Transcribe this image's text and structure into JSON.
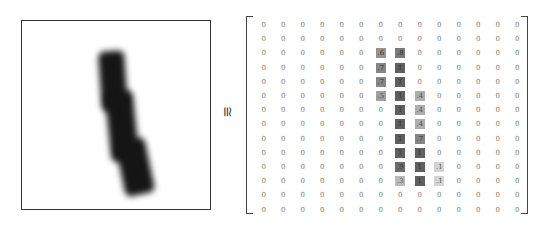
{
  "figure": {
    "image_label": "handwritten digit 1 (grayscale 28x28 rendering)",
    "relation_symbol": "≅",
    "matrix": {
      "rows": 14,
      "cols": 14,
      "values": [
        [
          "0",
          "0",
          "0",
          "0",
          "0",
          "0",
          "0",
          "0",
          "0",
          "0",
          "0",
          "0",
          "0",
          "0"
        ],
        [
          "0",
          "0",
          "0",
          "0",
          "0",
          "0",
          "0",
          "0",
          "0",
          "0",
          "0",
          "0",
          "0",
          "0"
        ],
        [
          "0",
          "0",
          "0",
          "0",
          "0",
          "0",
          ".6",
          ".8",
          "0",
          "0",
          "0",
          "0",
          "0",
          "0"
        ],
        [
          "0",
          "0",
          "0",
          "0",
          "0",
          "0",
          ".7",
          "1",
          "0",
          "0",
          "0",
          "0",
          "0",
          "0"
        ],
        [
          "0",
          "0",
          "0",
          "0",
          "0",
          "0",
          ".7",
          "1",
          "0",
          "0",
          "0",
          "0",
          "0",
          "0"
        ],
        [
          "0",
          "0",
          "0",
          "0",
          "0",
          "0",
          ".5",
          "1",
          ".4",
          "0",
          "0",
          "0",
          "0",
          "0"
        ],
        [
          "0",
          "0",
          "0",
          "0",
          "0",
          "0",
          "0",
          "1",
          ".4",
          "0",
          "0",
          "0",
          "0",
          "0"
        ],
        [
          "0",
          "0",
          "0",
          "0",
          "0",
          "0",
          "0",
          "1",
          ".4",
          "0",
          "0",
          "0",
          "0",
          "0"
        ],
        [
          "0",
          "0",
          "0",
          "0",
          "0",
          "0",
          "0",
          "1",
          ".7",
          "0",
          "0",
          "0",
          "0",
          "0"
        ],
        [
          "0",
          "0",
          "0",
          "0",
          "0",
          "0",
          "0",
          "1",
          "1",
          "0",
          "0",
          "0",
          "0",
          "0"
        ],
        [
          "0",
          "0",
          "0",
          "0",
          "0",
          "0",
          "0",
          ".9",
          "1",
          ".1",
          "0",
          "0",
          "0",
          "0"
        ],
        [
          "0",
          "0",
          "0",
          "0",
          "0",
          "0",
          "0",
          ".3",
          "1",
          ".1",
          "0",
          "0",
          "0",
          "0"
        ],
        [
          "0",
          "0",
          "0",
          "0",
          "0",
          "0",
          "0",
          "0",
          "0",
          "0",
          "0",
          "0",
          "0",
          "0"
        ],
        [
          "0",
          "0",
          "0",
          "0",
          "0",
          "0",
          "0",
          "0",
          "0",
          "0",
          "0",
          "0",
          "0",
          "0"
        ]
      ]
    }
  }
}
